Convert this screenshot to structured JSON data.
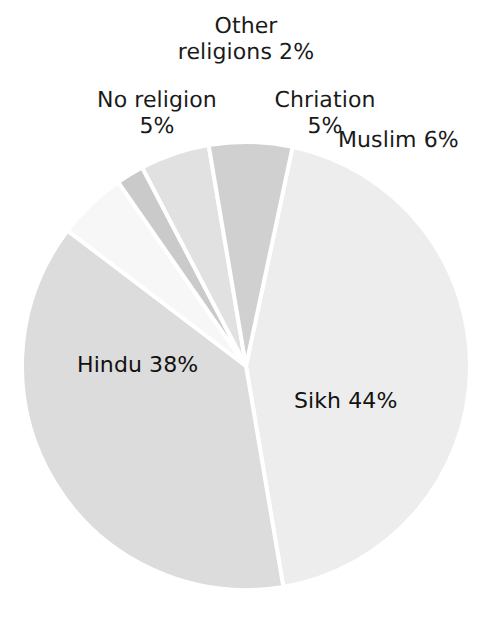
{
  "figure": {
    "background_color": "#ffffff",
    "width": 493,
    "height": 634
  },
  "chart_data": {
    "type": "pie",
    "title": "",
    "categories": [
      "Sikh",
      "Hindu",
      "No religion",
      "Other religions",
      "Chriation",
      "Muslim"
    ],
    "values": [
      44,
      38,
      5,
      2,
      5,
      6
    ],
    "unit": "%",
    "labels": [
      "Sikh 44%",
      "Hindu 38%",
      "No religion 5%",
      "Other religions 2%",
      "Chriation 5%",
      "Muslim 6%"
    ],
    "slice_colors": [
      "#ededed",
      "#dcdcdc",
      "#f7f7f7",
      "#cacaca",
      "#e1e1e1",
      "#d0d0d0"
    ],
    "slice_order": "clockwise from top, starting at Sikh",
    "start_angle_deg": 12,
    "separator_color": "#ffffff",
    "separator_width_px": 4,
    "legend": "none",
    "grid": false,
    "label_placement": "Sikh and Hindu inside slices; others outside above the pie",
    "center_x": 246,
    "center_y": 366,
    "radius": 224
  },
  "labels": {
    "other_religions": "Other\nreligions 2%",
    "no_religion": "No religion\n5%",
    "chriation": "Chriation\n5%",
    "muslim": "Muslim 6%",
    "hindu": "Hindu 38%",
    "sikh": "Sikh 44%"
  },
  "colors": {
    "text": "#1a1a1a",
    "sikh": "#ededed",
    "hindu": "#dcdcdc",
    "no_religion": "#f7f7f7",
    "other_religions": "#cacaca",
    "chriation": "#e1e1e1",
    "muslim": "#d0d0d0",
    "separator": "#ffffff"
  }
}
